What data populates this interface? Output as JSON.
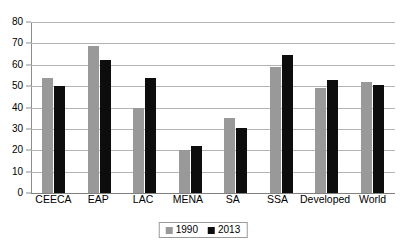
{
  "chart_data": {
    "type": "bar",
    "title": "",
    "subtitle": "",
    "xlabel": "",
    "ylabel": "",
    "ylim": [
      0,
      80
    ],
    "ytick_step": 10,
    "yticks": [
      "80",
      "70",
      "60",
      "50",
      "40",
      "30",
      "20",
      "10",
      "0"
    ],
    "grid": "horizontal",
    "legend_position": "bottom-center",
    "categories": [
      "CEECA",
      "EAP",
      "LAC",
      "MENA",
      "SA",
      "SSA",
      "Developed",
      "World"
    ],
    "series": [
      {
        "name": "1990",
        "color": "#999999",
        "values": [
          54,
          69,
          40,
          20,
          35,
          59,
          49,
          52
        ]
      },
      {
        "name": "2013",
        "color": "#0d0d0d",
        "values": [
          50,
          62,
          54,
          22,
          30.5,
          64.5,
          53,
          50.5
        ]
      }
    ]
  },
  "legend": {
    "items": [
      {
        "label": "1990",
        "color": "#999999"
      },
      {
        "label": "2013",
        "color": "#0d0d0d"
      }
    ]
  },
  "colors": {
    "series_1990": "#999999",
    "series_2013": "#0d0d0d",
    "gridline": "#b3b3b3",
    "axis": "#8c8c8c",
    "background": "#ffffff",
    "text": "#000000"
  }
}
